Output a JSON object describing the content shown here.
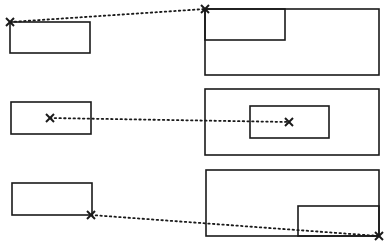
{
  "diagram": {
    "stroke_color": "#1a1a1a",
    "background": "#ffffff",
    "rows": [
      {
        "name": "top-left-anchor",
        "source_rect": {
          "x": 10,
          "y": 22,
          "w": 80,
          "h": 31
        },
        "source_marker": {
          "x": 10,
          "y": 22
        },
        "target_outer": {
          "x": 205,
          "y": 9,
          "w": 174,
          "h": 66
        },
        "target_inner": {
          "x": 205,
          "y": 9,
          "w": 80,
          "h": 31
        },
        "target_marker": {
          "x": 205,
          "y": 9
        }
      },
      {
        "name": "center-anchor",
        "source_rect": {
          "x": 11,
          "y": 102,
          "w": 80,
          "h": 32
        },
        "source_marker": {
          "x": 50,
          "y": 118
        },
        "target_outer": {
          "x": 205,
          "y": 89,
          "w": 174,
          "h": 66
        },
        "target_inner": {
          "x": 250,
          "y": 106,
          "w": 79,
          "h": 32
        },
        "target_marker": {
          "x": 289,
          "y": 122
        }
      },
      {
        "name": "bottom-right-anchor",
        "source_rect": {
          "x": 12,
          "y": 183,
          "w": 80,
          "h": 32
        },
        "source_marker": {
          "x": 91,
          "y": 215
        },
        "target_outer": {
          "x": 206,
          "y": 170,
          "w": 173,
          "h": 66
        },
        "target_inner": {
          "x": 298,
          "y": 206,
          "w": 81,
          "h": 30
        },
        "target_marker": {
          "x": 379,
          "y": 236
        }
      }
    ]
  }
}
